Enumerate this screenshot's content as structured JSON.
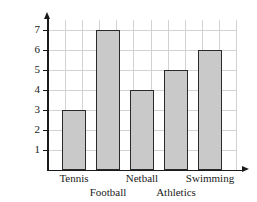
{
  "chart_data": {
    "type": "bar",
    "title": "",
    "xlabel": "",
    "ylabel": "Number of children",
    "categories": [
      "Tennis",
      "Football",
      "Netball",
      "Athletics",
      "Swimming"
    ],
    "values": [
      3,
      7,
      4,
      5,
      6
    ],
    "ylim": [
      0,
      7.6
    ],
    "yticks": [
      1,
      2,
      3,
      4,
      5,
      6,
      7
    ],
    "ytick_labels": [
      "1",
      "2",
      "3",
      "4",
      "5",
      "6",
      "7"
    ],
    "grid": true,
    "legend": null,
    "bar_fill_color": "#c9c9c9",
    "bar_edge_color": "#2a2a2a",
    "grid_color": "#d2d2d2",
    "axis_color": "#1a1a1a",
    "label_rows": {
      "top": [
        "Tennis",
        "Netball",
        "Swimming"
      ],
      "bottom": [
        "Football",
        "Athletics"
      ]
    }
  }
}
